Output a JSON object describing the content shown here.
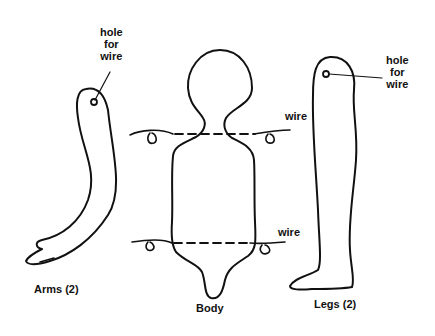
{
  "diagram": {
    "stroke_color": "#111111",
    "background": "#ffffff",
    "parts": {
      "arms": {
        "label": "Arms (2)"
      },
      "body": {
        "label": "Body"
      },
      "legs": {
        "label": "Legs (2)"
      }
    },
    "annotations": {
      "arm_hole": {
        "line1": "hole",
        "line2": "for",
        "line3": "wire"
      },
      "leg_hole": {
        "line1": "hole",
        "line2": "for",
        "line3": "wire"
      },
      "wire_top": "wire",
      "wire_bottom": "wire"
    }
  }
}
